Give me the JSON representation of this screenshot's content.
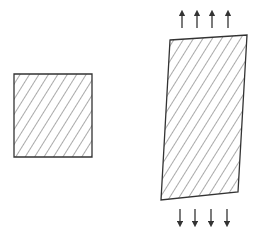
{
  "diagram": {
    "colors": {
      "stroke": "#333333",
      "hatch": "#555555",
      "background": "#ffffff"
    },
    "left_shape": {
      "label": "undeformed-element",
      "points": [
        [
          14,
          74
        ],
        [
          92,
          74
        ],
        [
          92,
          157
        ],
        [
          14,
          157
        ]
      ]
    },
    "right_shape": {
      "label": "deformed-element",
      "points": [
        [
          170,
          40
        ],
        [
          247,
          35
        ],
        [
          238,
          192
        ],
        [
          161,
          200
        ]
      ]
    },
    "arrows_up": {
      "count": 4,
      "x": [
        182,
        197,
        212,
        228
      ],
      "y_from": 28,
      "y_to": 13
    },
    "arrows_down": {
      "count": 4,
      "x": [
        180,
        195,
        211,
        227
      ],
      "y_from": 209,
      "y_to": 224
    }
  }
}
